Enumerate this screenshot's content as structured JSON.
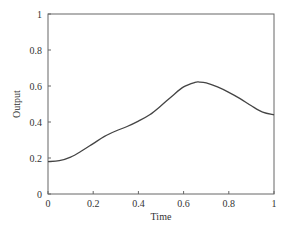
{
  "chart_data": {
    "type": "line",
    "title": "",
    "xlabel": "Time",
    "ylabel": "Output",
    "xlim": [
      0,
      1
    ],
    "ylim": [
      0,
      1
    ],
    "xticks": [
      "0",
      "0.2",
      "0.4",
      "0.6",
      "0.8",
      "1"
    ],
    "yticks": [
      "0",
      "0.2",
      "0.4",
      "0.6",
      "0.8",
      "1"
    ],
    "grid": false,
    "legend": null,
    "series": [
      {
        "name": "Output",
        "x": [
          0,
          0.05,
          0.1,
          0.15,
          0.2,
          0.25,
          0.3,
          0.35,
          0.4,
          0.45,
          0.5,
          0.55,
          0.6,
          0.65,
          0.67,
          0.7,
          0.75,
          0.8,
          0.85,
          0.9,
          0.95,
          1.0
        ],
        "values": [
          0.18,
          0.185,
          0.205,
          0.24,
          0.28,
          0.32,
          0.35,
          0.375,
          0.405,
          0.44,
          0.49,
          0.545,
          0.595,
          0.62,
          0.622,
          0.617,
          0.595,
          0.565,
          0.53,
          0.49,
          0.455,
          0.44
        ]
      }
    ],
    "colors": {
      "line": "#444444",
      "axes": "#555555"
    }
  }
}
